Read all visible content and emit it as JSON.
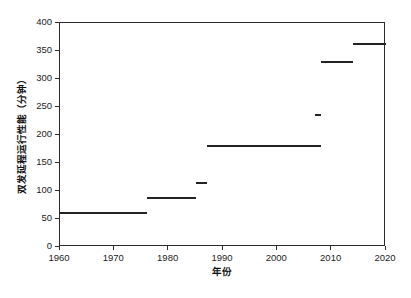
{
  "chart_data": {
    "type": "line",
    "title": "",
    "xlabel": "年份",
    "ylabel": "双发延程运行性能（分钟）",
    "xlim": [
      1960,
      2020
    ],
    "ylim": [
      0,
      400
    ],
    "grid": false,
    "legend": "none",
    "x_ticks": [
      "1960",
      "1970",
      "1980",
      "1990",
      "2000",
      "2010",
      "2020"
    ],
    "y_ticks": [
      "0",
      "50",
      "100",
      "150",
      "200",
      "250",
      "300",
      "350",
      "400"
    ],
    "series": [
      {
        "name": "ETOPS 认证时限",
        "style": "step-segments",
        "color": "#232323",
        "segments": [
          {
            "label": "60 分钟",
            "value": 60,
            "x_start": 1960,
            "x_end": 1976
          },
          {
            "label": "88 分钟",
            "value": 88,
            "x_start": 1976,
            "x_end": 1985
          },
          {
            "label": "115 分钟",
            "value": 115,
            "x_start": 1985,
            "x_end": 1987
          },
          {
            "label": "180 分钟",
            "value": 180,
            "x_start": 1987,
            "x_end": 2008
          },
          {
            "label": "235 分钟",
            "value": 235,
            "x_start": 2007,
            "x_end": 2008
          },
          {
            "label": "330 分钟",
            "value": 330,
            "x_start": 2008,
            "x_end": 2014
          },
          {
            "label": "363 分钟",
            "value": 363,
            "x_start": 2014,
            "x_end": 2020
          }
        ]
      }
    ]
  },
  "axes": {
    "y_title": "双发延程运行性能（分钟）",
    "x_title": "年份"
  }
}
